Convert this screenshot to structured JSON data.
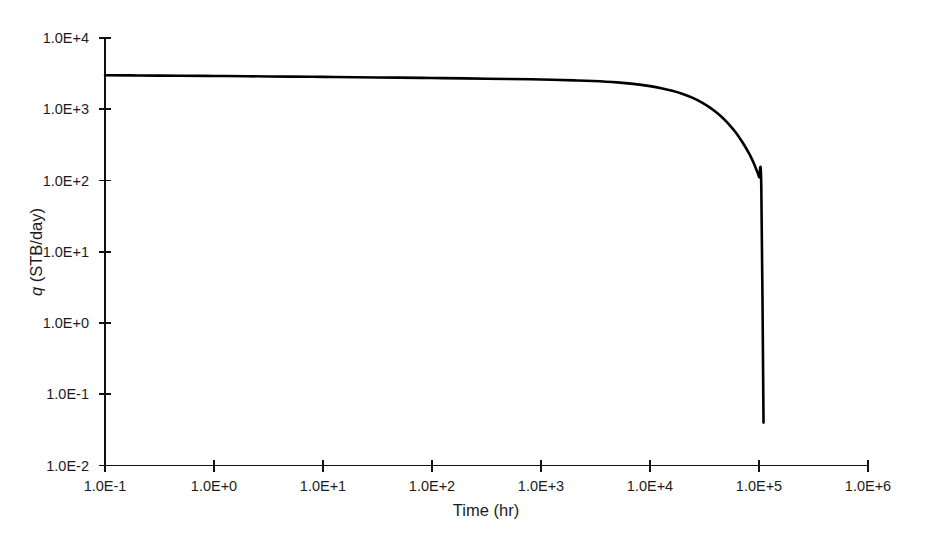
{
  "chart_data": {
    "type": "line",
    "title": "",
    "subtitle": "",
    "xlabel": "Time (hr)",
    "ylabel": "q (STB/day)",
    "ylabel_italic_prefix": "q",
    "ylabel_rest": " (STB/day)",
    "xscale": "log",
    "yscale": "log",
    "xlim": [
      0.1,
      1000000
    ],
    "ylim": [
      0.01,
      10000
    ],
    "grid": false,
    "legend": null,
    "legend_position": "none",
    "xticks": [
      0.1,
      1,
      10,
      100,
      1000,
      10000,
      100000,
      1000000
    ],
    "xtick_labels": [
      "1.0E-1",
      "1.0E+0",
      "1.0E+1",
      "1.0E+2",
      "1.0E+3",
      "1.0E+4",
      "1.0E+5",
      "1.0E+6"
    ],
    "yticks": [
      0.01,
      0.1,
      1,
      10,
      100,
      1000,
      10000
    ],
    "ytick_labels": [
      "1.0E-2",
      "1.0E-1",
      "1.0E+0",
      "1.0E+1",
      "1.0E+2",
      "1.0E+3",
      "1.0E+4"
    ],
    "series": [
      {
        "name": "q",
        "color": "#000000",
        "x": [
          0.1,
          0.2,
          0.5,
          1,
          2,
          5,
          10,
          20,
          50,
          100,
          200,
          500,
          1000,
          2000,
          3000,
          5000,
          7000,
          10000,
          13000,
          16000,
          20000,
          25000,
          30000,
          35000,
          40000,
          45000,
          50000,
          55000,
          60000,
          65000,
          70000,
          75000,
          80000,
          85000,
          90000,
          95000,
          100000,
          105000,
          110000
        ],
        "y": [
          3000,
          2980,
          2950,
          2930,
          2905,
          2870,
          2845,
          2815,
          2775,
          2745,
          2710,
          2660,
          2615,
          2545,
          2490,
          2380,
          2270,
          2110,
          1960,
          1820,
          1640,
          1430,
          1240,
          1070,
          920,
          790,
          675,
          575,
          490,
          415,
          350,
          295,
          248,
          208,
          172,
          140,
          112,
          80,
          0.04
        ]
      }
    ],
    "annotations": []
  },
  "axes": {
    "x_title": "Time (hr)",
    "y_title_italic": "q",
    "y_title_rest": " (STB/day)"
  },
  "style": {
    "background": "#ffffff",
    "axis_color": "#111111",
    "curve_color": "#000000",
    "text_color": "#1c1c1c"
  }
}
